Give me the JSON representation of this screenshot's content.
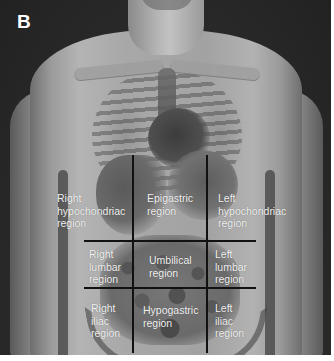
{
  "figure": {
    "panel_label": "B",
    "style": "grayscale",
    "colors": {
      "background": "#2b2b2b",
      "grid_line": "#111111",
      "label_text": "#f2f2f2",
      "panel_label": "#ffffff"
    }
  },
  "regions": [
    {
      "id": "right-hypochondriac",
      "label": "Right\nhypochondriac\nregion",
      "row": 1,
      "col": 1
    },
    {
      "id": "epigastric",
      "label": "Epigastric\nregion",
      "row": 1,
      "col": 2
    },
    {
      "id": "left-hypochondriac",
      "label": "Left\nhypochondriac\nregion",
      "row": 1,
      "col": 3
    },
    {
      "id": "right-lumbar",
      "label": "Right\nlumbar\nregion",
      "row": 2,
      "col": 1
    },
    {
      "id": "umbilical",
      "label": "Umbilical\nregion",
      "row": 2,
      "col": 2
    },
    {
      "id": "left-lumbar",
      "label": "Left\nlumbar\nregion",
      "row": 2,
      "col": 3
    },
    {
      "id": "right-iliac",
      "label": "Right\niliac\nregion",
      "row": 3,
      "col": 1
    },
    {
      "id": "hypogastric",
      "label": "Hypogastric\nregion",
      "row": 3,
      "col": 2
    },
    {
      "id": "left-iliac",
      "label": "Left\niliac\nregion",
      "row": 3,
      "col": 3
    }
  ]
}
